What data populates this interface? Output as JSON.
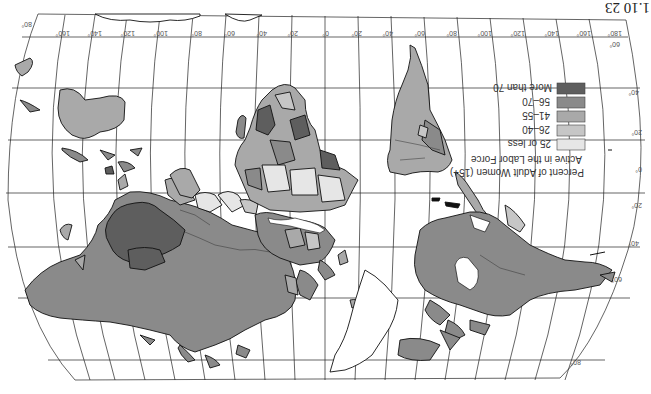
{
  "figure": {
    "caption_fragment": "1.10 23",
    "orientation": "upside-down (rotated 180°)",
    "projection_frame": "elliptical/pseudocylindrical world map"
  },
  "legend": {
    "title_line1": "Percent of Adult Women (15+)",
    "title_line2": "Active in the Labor Force",
    "items": [
      {
        "label": "25 or less",
        "color": "#e6e6e6"
      },
      {
        "label": "26–40",
        "color": "#c6c6c6"
      },
      {
        "label": "41–55",
        "color": "#a9a9a9"
      },
      {
        "label": "56–70",
        "color": "#8a8a8a"
      },
      {
        "label": "More than 70",
        "color": "#5e5e5e"
      }
    ]
  },
  "graticule": {
    "top_longitude_labels": [
      "80°",
      "160°",
      "140°",
      "120°",
      "100°",
      "80°",
      "60°",
      "40°",
      "20°",
      "0°",
      "20°",
      "40°",
      "60°",
      "80°",
      "100°",
      "120°",
      "140°",
      "160°",
      "180°"
    ],
    "right_latitude_labels": [
      "60°",
      "40°",
      "20°",
      "0°",
      "20°",
      "40°",
      "60°"
    ],
    "top_right_corner_label": "60°",
    "bottom_right_label": "80°",
    "top_left_label": "80°"
  },
  "colors": {
    "background": "#ffffff",
    "grid": "#222222",
    "coast": "#111111",
    "land_default": "#8f8f8f"
  }
}
